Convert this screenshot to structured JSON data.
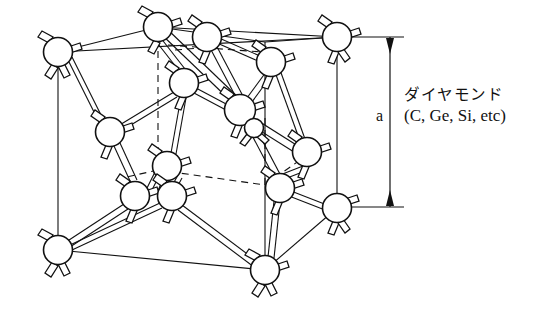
{
  "figure": {
    "name": "diamond-crystal-structure",
    "type": "crystal lattice unit cell diagram",
    "background_color": "#ffffff",
    "line_color": "#111111",
    "atom_fill": "#ffffff"
  },
  "dimension": {
    "label": "a",
    "orientation": "vertical",
    "arrow_style": "double-headed with end ticks",
    "top_y": 37,
    "bottom_y": 207
  },
  "caption": {
    "line1": "ダイヤモンド",
    "line2": "(C, Ge, Si, etc)"
  },
  "lattice": {
    "description": "Diamond cubic unit cell drawn in oblique projection with corner, face-centre and interior tetrahedral sites.",
    "cube": {
      "front_face": [
        [
          58,
          52
        ],
        [
          337,
          37
        ],
        [
          337,
          208
        ],
        [
          58,
          250
        ]
      ],
      "back_offset": [
        100,
        -25
      ]
    },
    "atoms": [
      {
        "id": "c1",
        "cx": 58,
        "cy": 52,
        "r": 14.5,
        "role": "corner"
      },
      {
        "id": "c2",
        "cx": 158,
        "cy": 27,
        "r": 14.5,
        "role": "corner"
      },
      {
        "id": "c3",
        "cx": 337,
        "cy": 37,
        "r": 14.5,
        "role": "corner"
      },
      {
        "id": "c4",
        "cx": 58,
        "cy": 250,
        "r": 14.5,
        "role": "corner"
      },
      {
        "id": "c5",
        "cx": 265,
        "cy": 270,
        "r": 14.5,
        "role": "corner"
      },
      {
        "id": "c6",
        "cx": 337,
        "cy": 208,
        "r": 14.5,
        "role": "corner"
      },
      {
        "id": "f1",
        "cx": 207,
        "cy": 37,
        "r": 14.5,
        "role": "face-center-top"
      },
      {
        "id": "f2",
        "cx": 271,
        "cy": 62,
        "r": 14.5,
        "role": "face-center-top"
      },
      {
        "id": "f3",
        "cx": 184,
        "cy": 83,
        "r": 14.5,
        "role": "face-center"
      },
      {
        "id": "f4",
        "cx": 110,
        "cy": 132,
        "r": 14.5,
        "role": "face-center-left"
      },
      {
        "id": "f5",
        "cx": 167,
        "cy": 166,
        "r": 14.5,
        "role": "face-center"
      },
      {
        "id": "f6",
        "cx": 307,
        "cy": 152,
        "r": 14.5,
        "role": "face-center-right"
      },
      {
        "id": "f7",
        "cx": 135,
        "cy": 196,
        "r": 14.5,
        "role": "face-center"
      },
      {
        "id": "f8",
        "cx": 280,
        "cy": 188,
        "r": 14.5,
        "role": "face-center"
      },
      {
        "id": "i1",
        "cx": 240,
        "cy": 110,
        "r": 15.5,
        "role": "interior-tetrahedral"
      },
      {
        "id": "i2",
        "cx": 172,
        "cy": 196,
        "r": 14.5,
        "role": "interior-tetrahedral"
      },
      {
        "id": "i3",
        "cx": 254,
        "cy": 128,
        "r": 9.5,
        "role": "interior-small"
      }
    ],
    "bond_count": 22,
    "bond_style": "double-line rod"
  },
  "legend_hint": {
    "materials": [
      "C",
      "Ge",
      "Si"
    ]
  }
}
